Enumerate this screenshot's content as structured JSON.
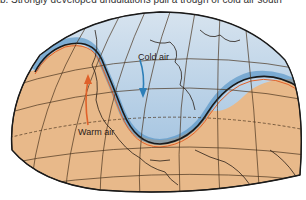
{
  "caption": "b. Strongly developed undulations pull a trough of cold air south",
  "labels": {
    "cold_air": "Cold air",
    "warm_air": "Warm air"
  },
  "colors": {
    "warm_land": "#e8b98a",
    "cold_air": "#a9c7e2",
    "cold_air_dark": "#3f86bf",
    "front_line": "#1a1a1a",
    "front_orange": "#e0612a",
    "grid": "#4a3520",
    "arrow_warm": "#e0612a",
    "arrow_cold": "#2d7fb8"
  }
}
